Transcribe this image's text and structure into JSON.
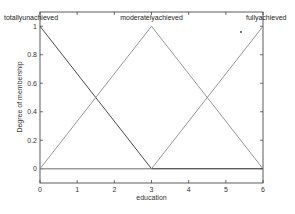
{
  "chart_data": {
    "type": "line",
    "title": "",
    "xlabel": "education",
    "ylabel": "Degree of membership",
    "xlim": [
      0,
      6
    ],
    "ylim": [
      -0.1,
      1.1
    ],
    "xticks": [
      0,
      1,
      2,
      3,
      4,
      5,
      6
    ],
    "yticks": [
      0,
      0.2,
      0.4,
      0.6,
      0.8,
      1
    ],
    "xtick_labels": [
      "0",
      "1",
      "2",
      "3",
      "4",
      "5",
      "6"
    ],
    "ytick_labels": [
      "0",
      "0.2",
      "0.4",
      "0.6",
      "0.8",
      "1"
    ],
    "grid": false,
    "legend": "none (labels placed above peaks)",
    "series": [
      {
        "name": "totallyunachieved",
        "params": [
          0,
          0,
          3
        ],
        "x": [
          0,
          3,
          6
        ],
        "y": [
          1,
          0,
          0
        ],
        "color": "#333333"
      },
      {
        "name": "moderatelyachieved",
        "params": [
          0,
          3,
          6
        ],
        "x": [
          0,
          3,
          6
        ],
        "y": [
          0,
          1,
          0
        ],
        "color": "#8a8a8a"
      },
      {
        "name": "fullyachieved",
        "params": [
          3,
          6,
          6
        ],
        "x": [
          0,
          3,
          6
        ],
        "y": [
          0,
          0,
          1
        ],
        "color": "#8a8a8a"
      }
    ]
  },
  "labels": {
    "mf1": "totallyunachieved",
    "mf2": "moderatelyachieved",
    "mf3": "fullyachieved",
    "xlabel": "education",
    "ylabel": "Degree of membership"
  },
  "ticks": {
    "x": [
      "0",
      "1",
      "2",
      "3",
      "4",
      "5",
      "6"
    ],
    "y": [
      "0",
      "0.2",
      "0.4",
      "0.6",
      "0.8",
      "1"
    ]
  },
  "colors": {
    "axis": "#333333",
    "mf_dark": "#333333",
    "mf_gray": "#8a8a8a",
    "zero_line": "#8a8a8a"
  }
}
